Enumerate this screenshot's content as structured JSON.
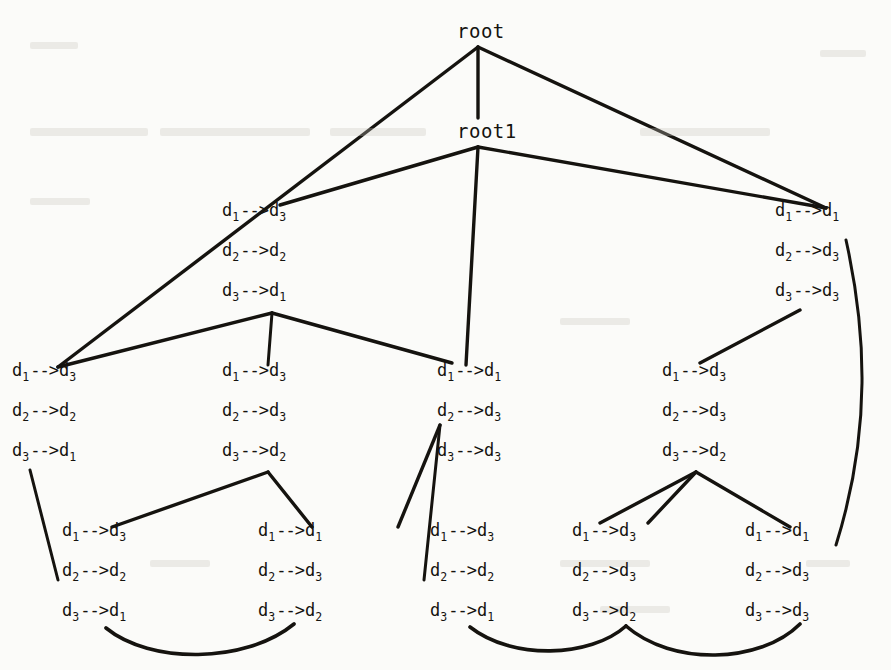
{
  "diagram": {
    "type": "tree",
    "title": "",
    "root_label": "root",
    "root1_label": "root1",
    "arrow": "-->",
    "symbol": "d",
    "nodes": [
      {
        "id": "root",
        "kind": "root",
        "label": "root",
        "x": 457,
        "y": 22
      },
      {
        "id": "root1",
        "kind": "root",
        "label": "root1",
        "x": 457,
        "y": 122
      },
      {
        "id": "n-l2-left",
        "kind": "map",
        "x": 222,
        "y": 202,
        "lines": [
          {
            "from": "1",
            "to": "3"
          },
          {
            "from": "2",
            "to": "2"
          },
          {
            "from": "3",
            "to": "1"
          }
        ]
      },
      {
        "id": "n-l2-right",
        "kind": "map",
        "x": 775,
        "y": 202,
        "lines": [
          {
            "from": "1",
            "to": "1"
          },
          {
            "from": "2",
            "to": "3"
          },
          {
            "from": "3",
            "to": "3"
          }
        ]
      },
      {
        "id": "n-l3-a",
        "kind": "map",
        "x": 12,
        "y": 362,
        "lines": [
          {
            "from": "1",
            "to": "3"
          },
          {
            "from": "2",
            "to": "2"
          },
          {
            "from": "3",
            "to": "1"
          }
        ]
      },
      {
        "id": "n-l3-b",
        "kind": "map",
        "x": 222,
        "y": 362,
        "lines": [
          {
            "from": "1",
            "to": "3"
          },
          {
            "from": "2",
            "to": "3"
          },
          {
            "from": "3",
            "to": "2"
          }
        ]
      },
      {
        "id": "n-l3-c",
        "kind": "map",
        "x": 437,
        "y": 362,
        "lines": [
          {
            "from": "1",
            "to": "1"
          },
          {
            "from": "2",
            "to": "3"
          },
          {
            "from": "3",
            "to": "3"
          }
        ]
      },
      {
        "id": "n-l3-d",
        "kind": "map",
        "x": 662,
        "y": 362,
        "lines": [
          {
            "from": "1",
            "to": "3"
          },
          {
            "from": "2",
            "to": "3"
          },
          {
            "from": "3",
            "to": "2"
          }
        ]
      },
      {
        "id": "n-l4-a",
        "kind": "map",
        "x": 62,
        "y": 522,
        "lines": [
          {
            "from": "1",
            "to": "3"
          },
          {
            "from": "2",
            "to": "2"
          },
          {
            "from": "3",
            "to": "1"
          }
        ]
      },
      {
        "id": "n-l4-b",
        "kind": "map",
        "x": 258,
        "y": 522,
        "lines": [
          {
            "from": "1",
            "to": "1"
          },
          {
            "from": "2",
            "to": "3"
          },
          {
            "from": "3",
            "to": "2"
          }
        ]
      },
      {
        "id": "n-l4-c",
        "kind": "map",
        "x": 430,
        "y": 522,
        "lines": [
          {
            "from": "1",
            "to": "3"
          },
          {
            "from": "2",
            "to": "2"
          },
          {
            "from": "3",
            "to": "1"
          }
        ]
      },
      {
        "id": "n-l4-d",
        "kind": "map",
        "x": 572,
        "y": 522,
        "lines": [
          {
            "from": "1",
            "to": "3"
          },
          {
            "from": "2",
            "to": "3"
          },
          {
            "from": "3",
            "to": "2"
          }
        ]
      },
      {
        "id": "n-l4-e",
        "kind": "map",
        "x": 745,
        "y": 522,
        "lines": [
          {
            "from": "1",
            "to": "1"
          },
          {
            "from": "2",
            "to": "3"
          },
          {
            "from": "3",
            "to": "3"
          }
        ]
      }
    ],
    "edges": [
      {
        "id": "e-root-left",
        "from": "root",
        "to": "n-l3-a",
        "shape": "line"
      },
      {
        "id": "e-root-root1",
        "from": "root",
        "to": "root1",
        "shape": "line"
      },
      {
        "id": "e-root-right",
        "from": "root",
        "to": "n-l2-right",
        "shape": "line"
      },
      {
        "id": "e-root1-left",
        "from": "root1",
        "to": "n-l2-left",
        "shape": "line"
      },
      {
        "id": "e-root1-mid",
        "from": "root1",
        "to": "n-l3-c",
        "shape": "line"
      },
      {
        "id": "e-root1-right",
        "from": "root1",
        "to": "n-l2-right",
        "shape": "line"
      },
      {
        "id": "e-l2l-a",
        "from": "n-l2-left",
        "to": "n-l3-a",
        "shape": "line"
      },
      {
        "id": "e-l2l-b",
        "from": "n-l2-left",
        "to": "n-l3-b",
        "shape": "line"
      },
      {
        "id": "e-l2l-c",
        "from": "n-l2-left",
        "to": "n-l3-c",
        "shape": "line"
      },
      {
        "id": "e-l2r-d",
        "from": "n-l2-right",
        "to": "n-l3-d",
        "shape": "line"
      },
      {
        "id": "e-l2r-e",
        "from": "n-l2-right",
        "to": "n-l4-e",
        "shape": "curve"
      },
      {
        "id": "e-l3a-l4a",
        "from": "n-l3-a",
        "to": "n-l4-a",
        "shape": "line"
      },
      {
        "id": "e-l3b-l4a",
        "from": "n-l3-b",
        "to": "n-l4-a",
        "shape": "line"
      },
      {
        "id": "e-l3b-l4b",
        "from": "n-l3-b",
        "to": "n-l4-b",
        "shape": "line"
      },
      {
        "id": "e-l3c-l4b",
        "from": "n-l3-c",
        "to": "n-l4-b",
        "shape": "line"
      },
      {
        "id": "e-l3c-l4c",
        "from": "n-l3-c",
        "to": "n-l4-c",
        "shape": "line"
      },
      {
        "id": "e-l3d-l4c",
        "from": "n-l3-d",
        "to": "n-l4-c",
        "shape": "line"
      },
      {
        "id": "e-l3d-l4d",
        "from": "n-l3-d",
        "to": "n-l4-d",
        "shape": "line"
      },
      {
        "id": "e-l3d-l4e",
        "from": "n-l3-d",
        "to": "n-l4-e",
        "shape": "line"
      },
      {
        "id": "e-l4a-l4b",
        "from": "n-l4-a",
        "to": "n-l4-b",
        "shape": "curve"
      },
      {
        "id": "e-l4c-l4d",
        "from": "n-l4-c",
        "to": "n-l4-d",
        "shape": "curve"
      },
      {
        "id": "e-l4d-l4e",
        "from": "n-l4-d",
        "to": "n-l4-e",
        "shape": "curve"
      }
    ]
  },
  "colors": {
    "ink": "#15130f",
    "paper": "#fbfbf9"
  }
}
